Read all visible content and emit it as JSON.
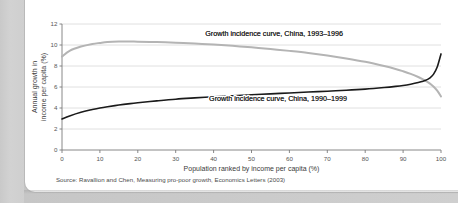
{
  "figure": {
    "source_note": "Source: Ravallion and Chen, Measuring pro-poor growth, Economics Letters (2003)"
  },
  "chart_data": {
    "type": "line",
    "title": "",
    "xlabel": "Population ranked by income per capita (%)",
    "ylabel": "Annual growth in income per capita (%)",
    "xlim": [
      0,
      100
    ],
    "ylim": [
      0,
      12
    ],
    "xticks": [
      "0",
      "10",
      "20",
      "30",
      "40",
      "50",
      "60",
      "70",
      "80",
      "90",
      "100"
    ],
    "yticks": [
      "0",
      "2",
      "4",
      "6",
      "8",
      "10",
      "12"
    ],
    "grid": "horizontal",
    "legend": "inline-labels",
    "colors": {
      "series_1993_1996": "#b4b4b4",
      "series_1990_1999": "#1a1a1a",
      "grid": "#d8d8d8",
      "axis": "#7a7a7a",
      "card_background": "#ffffff",
      "page_background": "#cfcfcf"
    },
    "annotations": [
      {
        "text": "Growth incidence curve, China, 1993–1996",
        "x": 56,
        "y": 10.85
      },
      {
        "text": "Growth incidence curve, China, 1990–1999",
        "x": 57,
        "y": 4.65
      }
    ],
    "x": [
      0,
      2,
      5,
      8,
      10,
      12,
      15,
      18,
      20,
      25,
      30,
      35,
      40,
      45,
      50,
      55,
      60,
      65,
      70,
      75,
      80,
      85,
      88,
      90,
      92,
      94,
      95,
      96,
      97,
      98,
      99,
      100
    ],
    "series": [
      {
        "name": "Growth incidence curve, China, 1993–1996",
        "color": "#b4b4b4",
        "values": [
          8.9,
          9.45,
          9.85,
          10.1,
          10.2,
          10.28,
          10.33,
          10.34,
          10.32,
          10.28,
          10.22,
          10.14,
          10.04,
          9.92,
          9.78,
          9.62,
          9.44,
          9.24,
          9.0,
          8.72,
          8.4,
          8.0,
          7.72,
          7.5,
          7.25,
          6.95,
          6.78,
          6.58,
          6.35,
          6.05,
          5.65,
          5.1
        ]
      },
      {
        "name": "Growth incidence curve, China, 1990–1999",
        "color": "#1a1a1a",
        "values": [
          2.95,
          3.25,
          3.6,
          3.85,
          4.0,
          4.12,
          4.28,
          4.42,
          4.5,
          4.68,
          4.84,
          4.96,
          5.07,
          5.17,
          5.26,
          5.35,
          5.43,
          5.52,
          5.6,
          5.69,
          5.8,
          5.95,
          6.06,
          6.15,
          6.27,
          6.42,
          6.52,
          6.65,
          6.85,
          7.2,
          7.9,
          9.15
        ]
      }
    ]
  }
}
